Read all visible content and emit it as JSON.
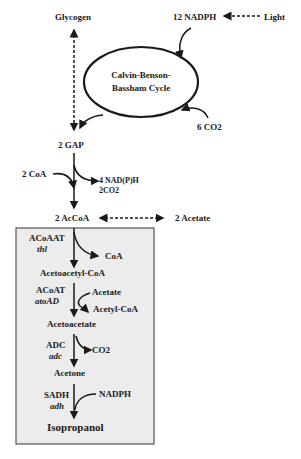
{
  "nodes": {
    "glycogen": "Glycogen",
    "nadph_12": "12 NADPH",
    "light": "Light",
    "cycle_line1": "Calvin-Benson-",
    "cycle_line2": "Bassham Cycle",
    "co2_6": "6 CO2",
    "gap_2": "2 GAP",
    "coa_2": "2 CoA",
    "nadph_4": "4 NAD(P)H",
    "co2_2": "2CO2",
    "accoa_2": "2 AcCoA",
    "acetate_2": "2 Acetate"
  },
  "pathway": {
    "steps": [
      {
        "enzyme": "ACoAAT",
        "gene": "thl",
        "side_out": "CoA"
      },
      {
        "product": "Acetoacetyl-CoA"
      },
      {
        "enzyme": "ACoAT",
        "gene": "atoAD",
        "side_in": "Acetate",
        "side_out": "Acetyl-CoA"
      },
      {
        "product": "Acetoacetate"
      },
      {
        "enzyme": "ADC",
        "gene": "adc",
        "side_out": "CO2"
      },
      {
        "product": "Acetone"
      },
      {
        "enzyme": "SADH",
        "gene": "adh",
        "side_in": "NADPH"
      },
      {
        "product": "Isopropanol"
      }
    ]
  },
  "colors": {
    "box_fill": "#ececec",
    "box_stroke": "#555555",
    "ink": "#1a1a1a"
  }
}
